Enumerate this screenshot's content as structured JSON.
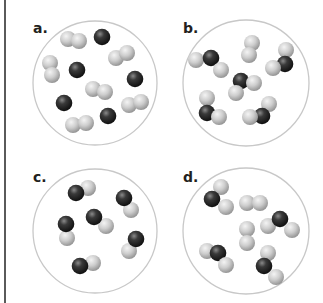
{
  "figure": {
    "colors": {
      "background": "#ffffff",
      "circle_stroke": "#c8c8c8",
      "dark_atom": "#2a2a2a",
      "light_atom": "#c4c4c4",
      "label": "#231f20",
      "frame_line": "#5a5a5a"
    },
    "panels": [
      {
        "label": "a.",
        "description": "Mixture of separate dark atoms and light diatomic molecules",
        "circle": {
          "cx": 95,
          "cy": 83,
          "r": 62
        },
        "label_pos": {
          "x": 33,
          "y": 21
        },
        "atoms": [
          {
            "x": 68,
            "y": 39,
            "type": "light"
          },
          {
            "x": 79,
            "y": 41,
            "type": "light"
          },
          {
            "x": 102,
            "y": 37,
            "type": "dark"
          },
          {
            "x": 116,
            "y": 58,
            "type": "light"
          },
          {
            "x": 127,
            "y": 53,
            "type": "light"
          },
          {
            "x": 50,
            "y": 63,
            "type": "light"
          },
          {
            "x": 52,
            "y": 75,
            "type": "light"
          },
          {
            "x": 77,
            "y": 70,
            "type": "dark"
          },
          {
            "x": 135,
            "y": 79,
            "type": "dark"
          },
          {
            "x": 93,
            "y": 89,
            "type": "light"
          },
          {
            "x": 105,
            "y": 92,
            "type": "light"
          },
          {
            "x": 64,
            "y": 103,
            "type": "dark"
          },
          {
            "x": 129,
            "y": 105,
            "type": "light"
          },
          {
            "x": 141,
            "y": 102,
            "type": "light"
          },
          {
            "x": 108,
            "y": 116,
            "type": "dark"
          },
          {
            "x": 73,
            "y": 125,
            "type": "light"
          },
          {
            "x": 86,
            "y": 123,
            "type": "light"
          }
        ]
      },
      {
        "label": "b.",
        "description": "Triatomic molecules with excess light diatomic molecules",
        "circle": {
          "cx": 246,
          "cy": 83,
          "r": 63
        },
        "label_pos": {
          "x": 183,
          "y": 21
        },
        "atoms": [
          {
            "x": 196,
            "y": 60,
            "type": "light"
          },
          {
            "x": 211,
            "y": 58,
            "type": "dark"
          },
          {
            "x": 221,
            "y": 70,
            "type": "light"
          },
          {
            "x": 252,
            "y": 43,
            "type": "light"
          },
          {
            "x": 249,
            "y": 55,
            "type": "light"
          },
          {
            "x": 286,
            "y": 50,
            "type": "light"
          },
          {
            "x": 285,
            "y": 64,
            "type": "dark"
          },
          {
            "x": 273,
            "y": 68,
            "type": "light"
          },
          {
            "x": 241,
            "y": 81,
            "type": "dark"
          },
          {
            "x": 254,
            "y": 83,
            "type": "light"
          },
          {
            "x": 236,
            "y": 93,
            "type": "light"
          },
          {
            "x": 207,
            "y": 98,
            "type": "light"
          },
          {
            "x": 207,
            "y": 113,
            "type": "dark"
          },
          {
            "x": 219,
            "y": 117,
            "type": "light"
          },
          {
            "x": 269,
            "y": 104,
            "type": "light"
          },
          {
            "x": 262,
            "y": 116,
            "type": "dark"
          },
          {
            "x": 250,
            "y": 117,
            "type": "light"
          }
        ]
      },
      {
        "label": "c.",
        "description": "Diatomic molecules each made of one dark and one light atom",
        "circle": {
          "cx": 95,
          "cy": 231,
          "r": 62
        },
        "label_pos": {
          "x": 33,
          "y": 170
        },
        "atoms": [
          {
            "x": 88,
            "y": 188,
            "type": "light"
          },
          {
            "x": 76,
            "y": 193,
            "type": "dark"
          },
          {
            "x": 131,
            "y": 210,
            "type": "light"
          },
          {
            "x": 124,
            "y": 198,
            "type": "dark"
          },
          {
            "x": 67,
            "y": 238,
            "type": "light"
          },
          {
            "x": 66,
            "y": 224,
            "type": "dark"
          },
          {
            "x": 106,
            "y": 226,
            "type": "light"
          },
          {
            "x": 94,
            "y": 217,
            "type": "dark"
          },
          {
            "x": 129,
            "y": 251,
            "type": "light"
          },
          {
            "x": 136,
            "y": 239,
            "type": "dark"
          },
          {
            "x": 93,
            "y": 263,
            "type": "light"
          },
          {
            "x": 80,
            "y": 266,
            "type": "dark"
          }
        ]
      },
      {
        "label": "d.",
        "description": "Triatomic molecules with excess light diatomic molecules",
        "circle": {
          "cx": 246,
          "cy": 231,
          "r": 63
        },
        "label_pos": {
          "x": 183,
          "y": 170
        },
        "atoms": [
          {
            "x": 221,
            "y": 187,
            "type": "light"
          },
          {
            "x": 212,
            "y": 199,
            "type": "dark"
          },
          {
            "x": 226,
            "y": 207,
            "type": "light"
          },
          {
            "x": 247,
            "y": 203,
            "type": "light"
          },
          {
            "x": 260,
            "y": 203,
            "type": "light"
          },
          {
            "x": 268,
            "y": 226,
            "type": "light"
          },
          {
            "x": 280,
            "y": 219,
            "type": "dark"
          },
          {
            "x": 292,
            "y": 230,
            "type": "light"
          },
          {
            "x": 247,
            "y": 229,
            "type": "light"
          },
          {
            "x": 247,
            "y": 243,
            "type": "light"
          },
          {
            "x": 207,
            "y": 251,
            "type": "light"
          },
          {
            "x": 218,
            "y": 253,
            "type": "dark"
          },
          {
            "x": 226,
            "y": 265,
            "type": "light"
          },
          {
            "x": 268,
            "y": 253,
            "type": "light"
          },
          {
            "x": 264,
            "y": 266,
            "type": "dark"
          },
          {
            "x": 276,
            "y": 277,
            "type": "light"
          }
        ]
      }
    ]
  }
}
